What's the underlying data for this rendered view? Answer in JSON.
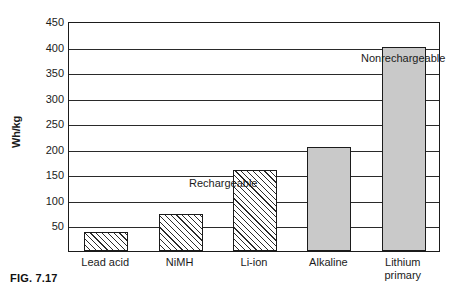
{
  "figure": {
    "caption": "FIG. 7.17"
  },
  "chart_data": {
    "type": "bar",
    "title": "",
    "xlabel": "",
    "ylabel": "Wh/kg",
    "ylim": [
      0,
      450
    ],
    "ytick_interval": 50,
    "yticks": [
      450,
      400,
      350,
      300,
      250,
      200,
      150,
      100,
      50
    ],
    "ytick_labels": [
      "450",
      "400",
      "350",
      "300",
      "250",
      "200",
      "150",
      "100",
      "50"
    ],
    "grid": true,
    "legend_position": "none",
    "categories": [
      "Lead acid",
      "NiMH",
      "Li-ion",
      "Alkaline",
      "Lithium primary"
    ],
    "values": [
      38,
      73,
      158,
      203,
      400
    ],
    "series": [
      {
        "name": "Specific energy",
        "values": [
          38,
          73,
          158,
          203,
          400
        ]
      }
    ],
    "bar_styles": [
      "hatched",
      "hatched",
      "hatched",
      "solid",
      "solid"
    ],
    "annotations": [
      {
        "text": "Rechargeable",
        "group": [
          "Lead acid",
          "NiMH",
          "Li-ion"
        ]
      },
      {
        "text": "Nonrechargeable",
        "group": [
          "Alkaline",
          "Lithium primary"
        ]
      }
    ],
    "colors": {
      "hatched_fill": "#ffffff",
      "hatch_stroke": "#2b2b2b",
      "solid_fill": "#c9c9c9",
      "axis": "#1b1b1b",
      "gridline": "#2a2a2a",
      "background": "#ffffff"
    }
  }
}
